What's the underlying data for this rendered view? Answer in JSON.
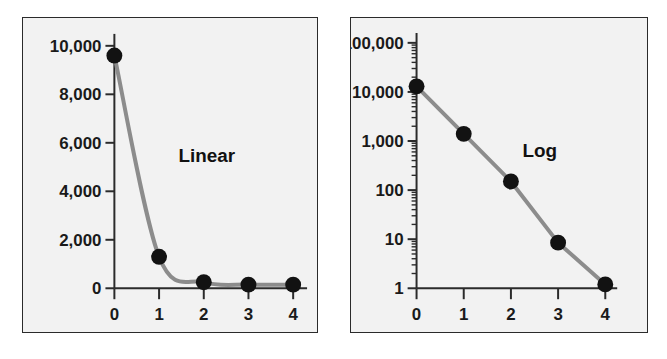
{
  "figure": {
    "background_color": "#ffffff",
    "panel_background_color": "#f2f2f2",
    "frame_color": "#2b2b2b",
    "line_color": "#8c8c8c",
    "marker_color": "#121212"
  },
  "panels": {
    "linear": {
      "annotation": "Linear",
      "y_tick_labels": [
        "10,000",
        "8,000",
        "6,000",
        "4,000",
        "2,000",
        "0"
      ],
      "x_tick_labels": [
        "0",
        "1",
        "2",
        "3",
        "4"
      ]
    },
    "log": {
      "annotation": "Log",
      "y_tick_labels": [
        "100,000",
        "10,000",
        "1,000",
        "100",
        "10",
        "1"
      ],
      "x_tick_labels": [
        "0",
        "1",
        "2",
        "3",
        "4"
      ]
    }
  },
  "chart_data": [
    {
      "type": "line",
      "title": "Linear",
      "xlabel": "",
      "ylabel": "",
      "x": [
        0,
        1,
        2,
        3,
        4
      ],
      "values": [
        9600,
        1300,
        250,
        150,
        150
      ],
      "categories": [
        "0",
        "1",
        "2",
        "3",
        "4"
      ],
      "yscale": "linear",
      "ylim": [
        0,
        10000
      ],
      "xlim": [
        0,
        4
      ],
      "y_ticks": [
        0,
        2000,
        4000,
        6000,
        8000,
        10000
      ],
      "y_tick_labels": [
        "0",
        "2,000",
        "4,000",
        "6,000",
        "8,000",
        "10,000"
      ],
      "x_ticks": [
        0,
        1,
        2,
        3,
        4
      ],
      "x_tick_labels": [
        "0",
        "1",
        "2",
        "3",
        "4"
      ],
      "grid": false,
      "legend": "none",
      "annotations": [
        "Linear"
      ],
      "markers": "filled-circle",
      "line_color": "#8c8c8c",
      "marker_color": "#121212"
    },
    {
      "type": "line",
      "title": "Log",
      "xlabel": "",
      "ylabel": "",
      "x": [
        0,
        1,
        2,
        3,
        4
      ],
      "values": [
        13000,
        1400,
        150,
        8.5,
        1.2
      ],
      "categories": [
        "0",
        "1",
        "2",
        "3",
        "4"
      ],
      "yscale": "log",
      "ylim": [
        1,
        100000
      ],
      "xlim": [
        0,
        4
      ],
      "y_ticks": [
        1,
        10,
        100,
        1000,
        10000,
        100000
      ],
      "y_tick_labels": [
        "1",
        "10",
        "100",
        "1,000",
        "10,000",
        "100,000"
      ],
      "x_ticks": [
        0,
        1,
        2,
        3,
        4
      ],
      "x_tick_labels": [
        "0",
        "1",
        "2",
        "3",
        "4"
      ],
      "grid": false,
      "minor_ticks": true,
      "legend": "none",
      "annotations": [
        "Log"
      ],
      "markers": "filled-circle",
      "line_color": "#8c8c8c",
      "marker_color": "#121212"
    }
  ]
}
